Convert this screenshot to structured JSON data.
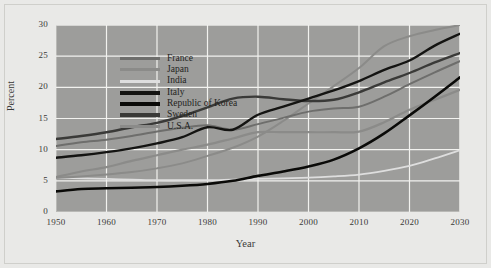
{
  "figure": {
    "background_color": "#e9e9e7",
    "plot_background_color": "#9d9d9b",
    "grid_color": "#f2f2ef"
  },
  "chart_data": {
    "type": "line",
    "title": "",
    "xlabel": "Year",
    "ylabel": "Percent",
    "xlim": [
      1950,
      2030
    ],
    "ylim": [
      0,
      30
    ],
    "xticks": [
      1950,
      1960,
      1970,
      1980,
      1990,
      2000,
      2010,
      2020,
      2030
    ],
    "yticks": [
      0,
      5,
      10,
      15,
      20,
      25,
      30
    ],
    "grid": true,
    "legend_position": "top-left",
    "x": [
      1950,
      1955,
      1960,
      1965,
      1970,
      1975,
      1980,
      1985,
      1990,
      1995,
      2000,
      2005,
      2010,
      2015,
      2020,
      2025,
      2030
    ],
    "series": [
      {
        "name": "France",
        "color": "#6e6e6c",
        "width": 2.0,
        "values": [
          10.6,
          11.2,
          11.6,
          12.2,
          12.9,
          13.5,
          13.9,
          13.2,
          14.1,
          15.1,
          16.1,
          16.6,
          16.9,
          18.5,
          20.5,
          22.4,
          24.2
        ]
      },
      {
        "name": "Japan",
        "color": "#8b8b89",
        "width": 2.0,
        "values": [
          5.5,
          5.7,
          6.0,
          6.4,
          7.0,
          7.8,
          9.0,
          10.3,
          12.1,
          14.6,
          17.4,
          20.2,
          23.1,
          26.6,
          28.2,
          29.2,
          30.0
        ]
      },
      {
        "name": "India",
        "color": "#dedede",
        "width": 1.8,
        "values": [
          5.5,
          5.4,
          5.3,
          5.2,
          5.1,
          5.1,
          5.1,
          5.2,
          5.3,
          5.4,
          5.5,
          5.7,
          6.0,
          6.6,
          7.4,
          8.6,
          9.9
        ]
      },
      {
        "name": "Italy",
        "color": "#141412",
        "width": 2.4,
        "values": [
          8.7,
          9.1,
          9.6,
          10.2,
          11.0,
          12.0,
          13.6,
          13.2,
          15.6,
          16.9,
          18.2,
          19.5,
          21.0,
          22.8,
          24.3,
          26.7,
          28.6
        ]
      },
      {
        "name": "Republic of Korea",
        "color": "#0a0a08",
        "width": 2.6,
        "values": [
          3.3,
          3.7,
          3.8,
          3.9,
          4.0,
          4.2,
          4.5,
          5.0,
          5.8,
          6.5,
          7.3,
          8.4,
          10.2,
          12.6,
          15.5,
          18.5,
          21.6
        ]
      },
      {
        "name": "Sweden",
        "color": "#3a3a38",
        "width": 2.4,
        "values": [
          11.7,
          12.2,
          12.8,
          13.6,
          14.3,
          15.4,
          16.8,
          18.2,
          18.5,
          18.1,
          17.8,
          18.0,
          19.2,
          20.8,
          22.3,
          24.0,
          25.5
        ]
      },
      {
        "name": "U.S.A.",
        "color": "#8b8b89",
        "width": 2.2,
        "values": [
          5.6,
          6.5,
          7.2,
          8.2,
          9.1,
          10.0,
          10.8,
          11.8,
          12.8,
          12.8,
          12.8,
          12.8,
          12.9,
          14.4,
          16.4,
          18.0,
          19.6
        ]
      }
    ]
  },
  "legend": {
    "items": [
      {
        "label": "France"
      },
      {
        "label": "Japan"
      },
      {
        "label": "India"
      },
      {
        "label": "Italy"
      },
      {
        "label": "Republic of Korea"
      },
      {
        "label": "Sweden"
      },
      {
        "label": "U.S.A."
      }
    ]
  }
}
